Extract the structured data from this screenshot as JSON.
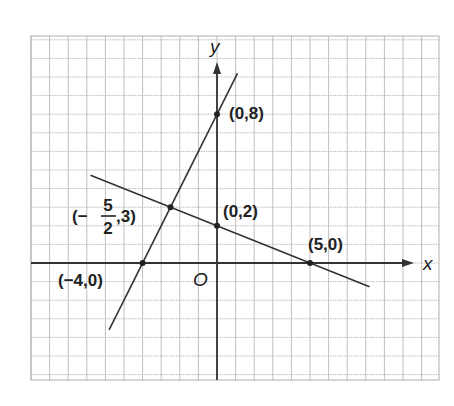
{
  "figure": {
    "axes": {
      "x_label": "x",
      "y_label": "y",
      "origin_label": "O",
      "x_grid_range": [
        -10,
        12
      ],
      "y_grid_range": [
        -6,
        12
      ]
    },
    "lines": [
      {
        "name": "line-y-eq-2x-plus-8",
        "equation": "y = 2x + 8",
        "from": [
          -5.8,
          -3.6
        ],
        "to": [
          1.1,
          10.2
        ],
        "color": "#333333"
      },
      {
        "name": "line-y-eq-neg-2-5x-plus-2",
        "equation": "y = -2/5 x + 2",
        "from": [
          -6.8,
          4.72
        ],
        "to": [
          8.2,
          -1.28
        ],
        "color": "#333333"
      }
    ],
    "points": [
      {
        "name": "point-0-8",
        "x": 0,
        "y": 8,
        "label": "(0,8)"
      },
      {
        "name": "point-0-2",
        "x": 0,
        "y": 2,
        "label": "(0,2)"
      },
      {
        "name": "point-5-0",
        "x": 5,
        "y": 0,
        "label": "(5,0)"
      },
      {
        "name": "point-neg4-0",
        "x": -4,
        "y": 0,
        "label": "(−4,0)"
      },
      {
        "name": "point-intersection",
        "x": -2.5,
        "y": 3,
        "label_prefix": "(−",
        "label_num": "5",
        "label_den": "2",
        "label_suffix": ",3)"
      }
    ],
    "colors": {
      "grid": "#b8b8b8",
      "axis": "#333333",
      "text": "#222222"
    }
  }
}
